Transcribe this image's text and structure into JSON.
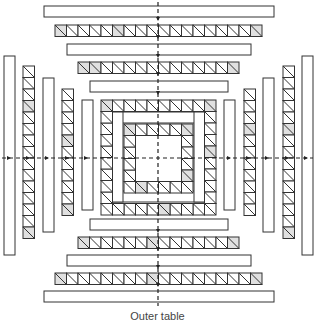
{
  "figure": {
    "caption": "Outer table",
    "stroke_color": "#333333",
    "fill_plain": "#ffffff",
    "fill_shaded": "#e0e0e0",
    "cell_size": 11.5
  },
  "plain_bars_h": [
    {
      "x": 44,
      "y": 6,
      "w": 230,
      "h": 11
    },
    {
      "x": 67,
      "y": 44,
      "w": 184,
      "h": 11
    },
    {
      "x": 90,
      "y": 81,
      "w": 138,
      "h": 11
    },
    {
      "x": 90,
      "y": 219,
      "w": 138,
      "h": 11
    },
    {
      "x": 67,
      "y": 255,
      "w": 184,
      "h": 11
    },
    {
      "x": 44,
      "y": 291,
      "w": 230,
      "h": 11
    }
  ],
  "plain_bars_v": [
    {
      "x": 4,
      "y": 56,
      "w": 11,
      "h": 199
    },
    {
      "x": 43,
      "y": 78,
      "w": 11,
      "h": 154
    },
    {
      "x": 82,
      "y": 100,
      "w": 11,
      "h": 110
    },
    {
      "x": 224,
      "y": 100,
      "w": 11,
      "h": 110
    },
    {
      "x": 263,
      "y": 78,
      "w": 11,
      "h": 154
    },
    {
      "x": 302,
      "y": 56,
      "w": 11,
      "h": 199
    }
  ],
  "hatched_bars_h": [
    {
      "x": 55,
      "y": 25,
      "cells": 18,
      "shaded": [
        0,
        5,
        17
      ]
    },
    {
      "x": 78,
      "y": 62,
      "cells": 14,
      "shaded": [
        0,
        1,
        13
      ]
    },
    {
      "x": 78,
      "y": 237,
      "cells": 14,
      "shaded": [
        0,
        6,
        13
      ]
    },
    {
      "x": 55,
      "y": 273,
      "cells": 18,
      "shaded": [
        0,
        8,
        17
      ]
    }
  ],
  "hatched_bars_v": [
    {
      "x": 23,
      "y": 66,
      "cells": 15,
      "shaded": [
        3,
        14
      ]
    },
    {
      "x": 62,
      "y": 89,
      "cells": 11,
      "shaded": [
        4,
        10
      ]
    },
    {
      "x": 244,
      "y": 89,
      "cells": 11,
      "shaded": [
        3
      ]
    },
    {
      "x": 283,
      "y": 66,
      "cells": 15,
      "shaded": [
        5,
        14
      ]
    }
  ],
  "center_rings": [
    {
      "x": 101,
      "y": 100,
      "n": 10,
      "shaded": [
        0,
        9,
        13,
        22
      ]
    },
    {
      "x": 124,
      "y": 124,
      "n": 6,
      "shaded": [
        0,
        5,
        9,
        14
      ]
    }
  ],
  "center_bands": [
    {
      "x": 112,
      "y": 112,
      "w": 93,
      "h": 11
    },
    {
      "x": 112,
      "y": 191,
      "w": 93,
      "h": 11
    },
    {
      "x": 112,
      "y": 112,
      "w": 11,
      "h": 90
    },
    {
      "x": 194,
      "y": 112,
      "w": 11,
      "h": 90
    }
  ],
  "axes": {
    "center_x": 158,
    "center_y": 158
  }
}
